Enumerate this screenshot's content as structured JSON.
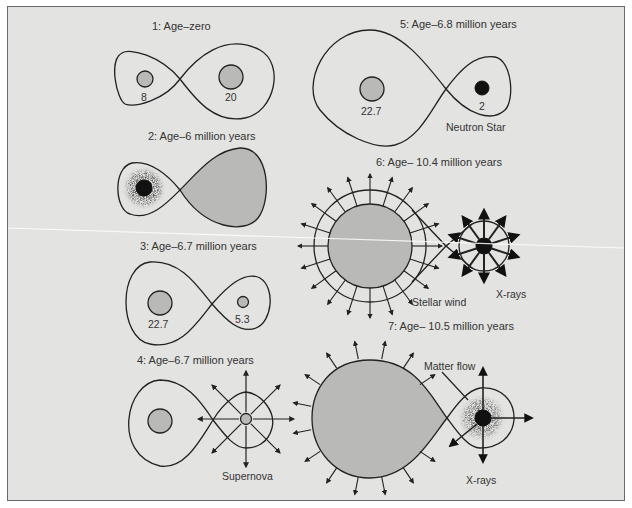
{
  "figure": {
    "panels": [
      {
        "id": "1",
        "title": "1: Age–zero",
        "labels": [
          "8",
          "20"
        ]
      },
      {
        "id": "2",
        "title": "2: Age–6 million years",
        "labels": []
      },
      {
        "id": "3",
        "title": "3: Age–6.7 million years",
        "labels": [
          "22.7",
          "5.3"
        ]
      },
      {
        "id": "4",
        "title": "4: Age–6.7 million years",
        "labels": [
          "Supernova"
        ]
      },
      {
        "id": "5",
        "title": "5: Age–6.8 million years",
        "labels": [
          "22.7",
          "2",
          "Neutron Star"
        ]
      },
      {
        "id": "6",
        "title": "6: Age– 10.4 million years",
        "labels": [
          "Stellar wind",
          "X-rays"
        ]
      },
      {
        "id": "7",
        "title": "7: Age– 10.5 million years",
        "labels": [
          "Matter flow",
          "X-rays"
        ]
      }
    ]
  },
  "colors": {
    "background": "#e3e3e1",
    "star_gray": "#b9b9b7",
    "line": "#222222",
    "compact_object": "#111111"
  }
}
